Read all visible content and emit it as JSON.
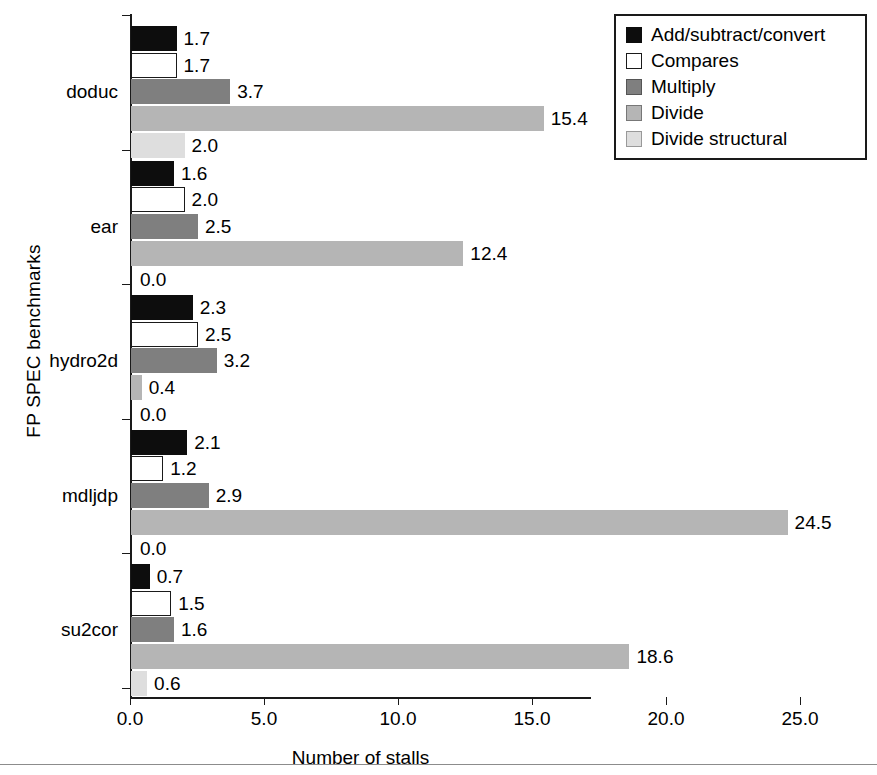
{
  "chart_data": {
    "type": "bar",
    "orientation": "horizontal",
    "title": "",
    "xlabel": "Number of stalls",
    "ylabel": "FP SPEC benchmarks",
    "xlim": [
      0,
      25
    ],
    "xticks": [
      "0.0",
      "5.0",
      "10.0",
      "15.0",
      "20.0",
      "25.0"
    ],
    "xtick_values": [
      0,
      5,
      10,
      15,
      20,
      25
    ],
    "grid": false,
    "legend_position": "top-right",
    "categories": [
      "doduc",
      "ear",
      "hydro2d",
      "mdljdp",
      "su2cor"
    ],
    "series": [
      {
        "name": "Add/subtract/convert",
        "color": "#0d0d0d",
        "values": [
          1.7,
          1.6,
          2.3,
          2.1,
          0.7
        ],
        "labels": [
          "1.7",
          "1.6",
          "2.3",
          "2.1",
          "0.7"
        ]
      },
      {
        "name": "Compares",
        "color": "#ffffff",
        "values": [
          1.7,
          2.0,
          2.5,
          1.2,
          1.5
        ],
        "labels": [
          "1.7",
          "2.0",
          "2.5",
          "1.2",
          "1.5"
        ]
      },
      {
        "name": "Multiply",
        "color": "#7f7f7f",
        "values": [
          3.7,
          2.5,
          3.2,
          2.9,
          1.6
        ],
        "labels": [
          "3.7",
          "2.5",
          "3.2",
          "2.9",
          "1.6"
        ]
      },
      {
        "name": "Divide",
        "color": "#b5b5b5",
        "values": [
          15.4,
          12.4,
          0.4,
          24.5,
          18.6
        ],
        "labels": [
          "15.4",
          "12.4",
          "0.4",
          "24.5",
          "18.6"
        ]
      },
      {
        "name": "Divide structural",
        "color": "#dedede",
        "values": [
          2.0,
          0.0,
          0.0,
          0.0,
          0.6
        ],
        "labels": [
          "2.0",
          "0.0",
          "0.0",
          "0.0",
          "0.6"
        ]
      }
    ]
  },
  "axes": {
    "xlabel": "Number of stalls",
    "ylabel": "FP SPEC benchmarks",
    "xticks": [
      "0.0",
      "5.0",
      "10.0",
      "15.0",
      "20.0",
      "25.0"
    ]
  },
  "legend": {
    "items": [
      {
        "label": "Add/subtract/convert",
        "swatch": "black-swatch"
      },
      {
        "label": "Compares",
        "swatch": "white-swatch"
      },
      {
        "label": "Multiply",
        "swatch": "dark-gray-swatch"
      },
      {
        "label": "Divide",
        "swatch": "medium-gray-swatch"
      },
      {
        "label": "Divide structural",
        "swatch": "light-gray-swatch"
      }
    ]
  },
  "groups": [
    {
      "label": "doduc",
      "values": [
        "1.7",
        "1.7",
        "3.7",
        "15.4",
        "2.0"
      ]
    },
    {
      "label": "ear",
      "values": [
        "1.6",
        "2.0",
        "2.5",
        "12.4",
        "0.0"
      ]
    },
    {
      "label": "hydro2d",
      "values": [
        "2.3",
        "2.5",
        "3.2",
        "0.4",
        "0.0"
      ]
    },
    {
      "label": "mdljdp",
      "values": [
        "2.1",
        "1.2",
        "2.9",
        "24.5",
        "0.0"
      ]
    },
    {
      "label": "su2cor",
      "values": [
        "0.7",
        "1.5",
        "1.6",
        "18.6",
        "0.6"
      ]
    }
  ]
}
